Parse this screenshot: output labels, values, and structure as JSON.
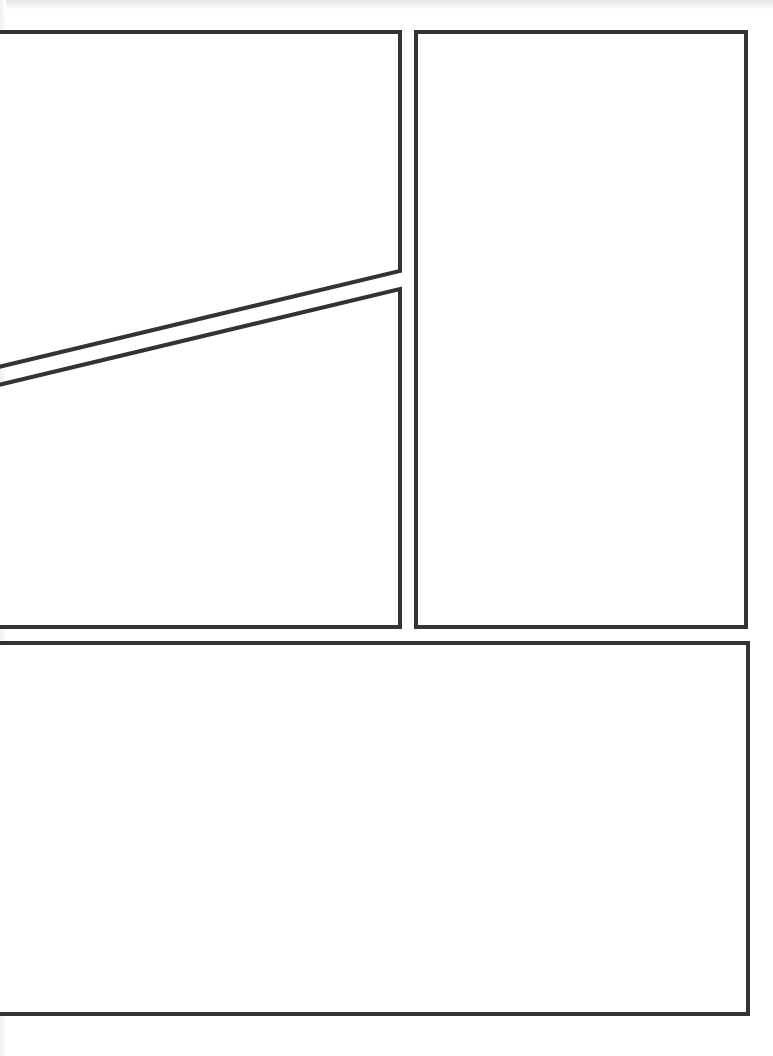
{
  "page": {
    "type": "comic-page-template",
    "background": "#ffffff",
    "border_color": "#333333",
    "border_width": 4
  },
  "panels": [
    {
      "id": "panel-top-left",
      "points": "-10,32 400,32 400,271 -10,369"
    },
    {
      "id": "panel-middle-left",
      "points": "-10,387 400,289 400,627 -10,627"
    },
    {
      "id": "panel-right",
      "points": "416,32 746,32 746,627 416,627"
    },
    {
      "id": "panel-bottom",
      "points": "-10,643 748,643 748,1014 -10,1014"
    }
  ]
}
